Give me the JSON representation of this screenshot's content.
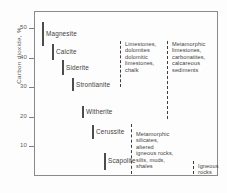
{
  "chart_data": {
    "type": "bar",
    "title": "",
    "xlabel": "",
    "ylabel": "Carbon dioxide, %",
    "ylim": [
      0,
      55
    ],
    "yticks": [
      10,
      20,
      30,
      40,
      50
    ],
    "grid": false,
    "legend": "none",
    "orientation": "vertical-ranges",
    "series": [
      {
        "name": "minerals",
        "style": "solid",
        "items": [
          {
            "label": "Magnesite",
            "low": 44.0,
            "high": 52.0
          },
          {
            "label": "Calcite",
            "low": 39.0,
            "high": 44.5
          },
          {
            "label": "Siderite",
            "low": 34.0,
            "high": 39.0
          },
          {
            "label": "Strontianite",
            "low": 28.5,
            "high": 33.0
          },
          {
            "label": "Witherite",
            "low": 19.5,
            "high": 23.5
          },
          {
            "label": "Cerussite",
            "low": 12.5,
            "high": 17.0
          },
          {
            "label": "Scapolite",
            "low": 2.0,
            "high": 7.5
          }
        ]
      },
      {
        "name": "rock-groups",
        "style": "dashed",
        "items": [
          {
            "label": "Limestones,\ndolomites\ndolomitic\nlimestones,\nchalk",
            "low": 30.0,
            "high": 45.5
          },
          {
            "label": "Metamorphic\nlimestones,\ncarbonatites,\ncalcareous\nsediments",
            "low": 19.0,
            "high": 45.5
          },
          {
            "label": "Metamorphic\nsilicates,\naltered\nigneous rocks,\nsilts, muds,\nshales",
            "low": 0.5,
            "high": 17.5
          },
          {
            "label": "Igneous\nrocks",
            "low": 0.5,
            "high": 5.0
          }
        ]
      }
    ]
  },
  "axis": {
    "y_title": "Carbon dioxide, %",
    "tick_labels": [
      "50",
      "40",
      "30",
      "20",
      "10"
    ]
  },
  "minerals": {
    "magnesite": "Magnesite",
    "calcite": "Calcite",
    "siderite": "Siderite",
    "strontianite": "Strontianite",
    "witherite": "Witherite",
    "cerussite": "Cerussite",
    "scapolite": "Scapolite"
  },
  "groups": {
    "limestones": "Limestones,\ndolomites\ndolomitic\nlimestones,\nchalk",
    "metamorphic_limestones": "Metamorphic\nlimestones,\ncarbonatites,\ncalcareous\nsediments",
    "metamorphic_silicates": "Metamorphic\nsilicates,\naltered\nigneous rocks,\nsilts, muds,\nshales",
    "igneous": "Igneous\nrocks"
  }
}
